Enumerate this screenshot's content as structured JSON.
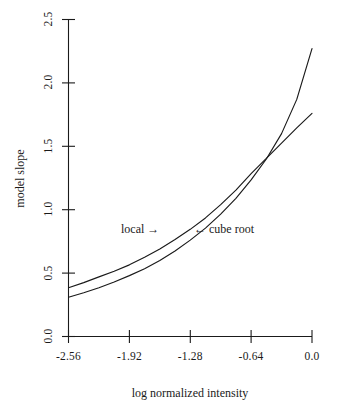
{
  "chart_data": {
    "type": "line",
    "title": "",
    "xlabel": "log normalized intensity",
    "ylabel": "model slope",
    "xlim": [
      -2.56,
      0.0
    ],
    "ylim": [
      0.0,
      2.5
    ],
    "grid": false,
    "legend": "none",
    "xticks": [
      "-2.56",
      "-1.92",
      "-1.28",
      "-0.64",
      "0.0"
    ],
    "xtick_values": [
      -2.56,
      -1.92,
      -1.28,
      -0.64,
      0.0
    ],
    "yticks": [
      "0.0",
      "0.5",
      "1.0",
      "1.5",
      "2.0",
      "2.5"
    ],
    "ytick_values": [
      0.0,
      0.5,
      1.0,
      1.5,
      2.0,
      2.5
    ],
    "annotations": [
      {
        "id": "local",
        "text": "local  →",
        "x": -1.75,
        "y": 0.86
      },
      {
        "id": "cube-root",
        "text": "←  cube  root",
        "x": -1.06,
        "y": 0.86
      }
    ],
    "series": [
      {
        "name": "local",
        "x": [
          -2.56,
          -2.4,
          -2.24,
          -2.08,
          -1.92,
          -1.76,
          -1.6,
          -1.44,
          -1.28,
          -1.12,
          -0.96,
          -0.8,
          -0.64,
          -0.48,
          -0.32,
          -0.16,
          0.0
        ],
        "values": [
          0.31,
          0.345,
          0.385,
          0.43,
          0.48,
          0.535,
          0.6,
          0.675,
          0.76,
          0.855,
          0.965,
          1.09,
          1.235,
          1.4,
          1.6,
          1.87,
          2.27
        ]
      },
      {
        "name": "cube root",
        "x": [
          -2.56,
          -2.4,
          -2.24,
          -2.08,
          -1.92,
          -1.76,
          -1.6,
          -1.44,
          -1.28,
          -1.12,
          -0.96,
          -0.8,
          -0.64,
          -0.48,
          -0.32,
          -0.16,
          0.0
        ],
        "values": [
          0.385,
          0.425,
          0.47,
          0.515,
          0.565,
          0.625,
          0.69,
          0.765,
          0.845,
          0.935,
          1.04,
          1.155,
          1.285,
          1.405,
          1.525,
          1.645,
          1.76
        ]
      }
    ]
  },
  "axis_titles": {
    "x": "log normalized intensity",
    "y": "model slope"
  },
  "colors": {
    "background": "#ffffff",
    "ink": "#1a1a1a",
    "curve_local": "#1a1a1a",
    "curve_cube_root": "#1a1a1a"
  }
}
